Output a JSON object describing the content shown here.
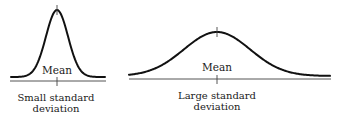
{
  "diagram": {
    "panels": [
      {
        "id": "small",
        "mean_label": "Mean",
        "caption_line1": "Small standard",
        "caption_line2": "deviation",
        "curve": {
          "peak_x": 57,
          "peak_y": 10,
          "base_y": 77,
          "left_x": 11,
          "right_x": 105,
          "sigma_px": 11
        }
      },
      {
        "id": "large",
        "mean_label": "Mean",
        "caption_line1": "Large standard",
        "caption_line2": "deviation",
        "curve": {
          "peak_x": 217,
          "peak_y": 32,
          "base_y": 76,
          "left_x": 129,
          "right_x": 330,
          "sigma_px": 33
        }
      }
    ],
    "colors": {
      "curve": "#111111",
      "axis": "#555555",
      "text": "#1a1a1a"
    }
  }
}
